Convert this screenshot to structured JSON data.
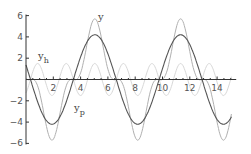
{
  "chart_data": {
    "type": "line",
    "title": "",
    "xlabel": "",
    "ylabel": "",
    "xlim": [
      0,
      15.4
    ],
    "ylim": [
      -6,
      6
    ],
    "x_ticks": [
      2,
      4,
      6,
      8,
      10,
      12,
      14
    ],
    "y_ticks": [
      -6,
      -4,
      -2,
      2,
      4,
      6
    ],
    "grid": false,
    "legend": "inline labels",
    "series": [
      {
        "name": "y",
        "label": "y",
        "color": "#b0b0b0",
        "description": "y = y_p + y_h",
        "amplitude": 5.7
      },
      {
        "name": "y_h",
        "label": "y_h",
        "color": "#d8d8d8",
        "amplitude": 1.5,
        "omega": 3,
        "phase_t": 1.9,
        "sign": -1
      },
      {
        "name": "y_p",
        "label": "y_p",
        "color": "#555555",
        "amplitude": 4.2,
        "omega": 1,
        "phase_t": 1.9,
        "sign": -1
      }
    ],
    "annotations": [
      {
        "text": "y",
        "x": 5.5,
        "y": 5.7
      },
      {
        "text": "y_h",
        "x": 0.4,
        "y": 2.0
      },
      {
        "text": "y_p",
        "x": 3.6,
        "y": -2.6
      }
    ]
  }
}
